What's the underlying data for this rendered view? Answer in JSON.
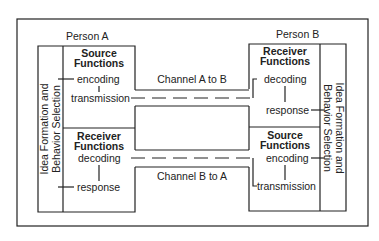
{
  "diagram": {
    "person_a": {
      "label": "Person A",
      "side_label_line1": "Idea Formation and",
      "side_label_line2": "Behavior Selection",
      "source": {
        "title_line1": "Source",
        "title_line2": "Functions",
        "step1": "encoding",
        "step2": "transmission"
      },
      "receiver": {
        "title_line1": "Receiver",
        "title_line2": "Functions",
        "step1": "decoding",
        "step2": "response"
      }
    },
    "person_b": {
      "label": "Person B",
      "side_label_line1": "Idea Formation and",
      "side_label_line2": "Behavior Selection",
      "receiver": {
        "title_line1": "Receiver",
        "title_line2": "Functions",
        "step1": "decoding",
        "step2": "response"
      },
      "source": {
        "title_line1": "Source",
        "title_line2": "Functions",
        "step1": "encoding",
        "step2": "transmission"
      }
    },
    "channels": {
      "a_to_b": "Channel A to B",
      "b_to_a": "Channel B to A"
    },
    "colors": {
      "line": "#222222",
      "background": "#ffffff"
    }
  }
}
